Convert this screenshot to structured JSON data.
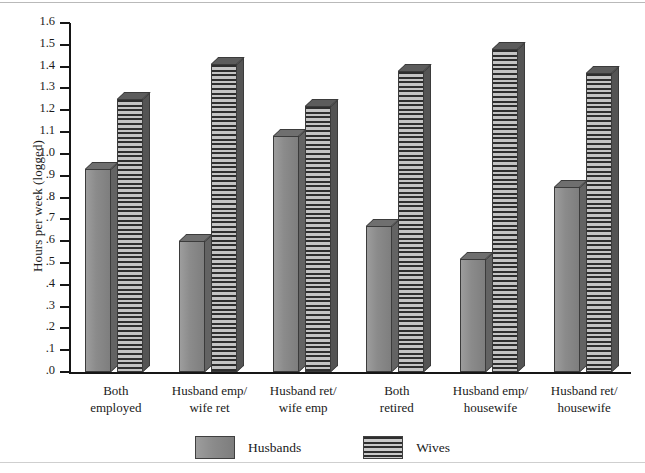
{
  "chart_data": {
    "type": "bar",
    "title": "",
    "subtitle": "",
    "xlabel": "",
    "ylabel": "Hours per week (logged)",
    "ylim": [
      0.0,
      1.6
    ],
    "ytick_step": 0.1,
    "grid": false,
    "legend_position": "bottom-center",
    "categories": [
      "Both\nemployed",
      "Husband emp/\nwife ret",
      "Husband ret/\nwife emp",
      "Both\nretired",
      "Husband emp/\nhousewife",
      "Husband ret/\nhousewife"
    ],
    "series": [
      {
        "name": "Husbands",
        "color": "#8b8b8b",
        "fill": "solid-gray",
        "values": [
          0.93,
          0.6,
          1.08,
          0.67,
          0.52,
          0.85
        ]
      },
      {
        "name": "Wives",
        "color": "#5c5c5c",
        "fill": "horizontal-hatch",
        "values": [
          1.25,
          1.41,
          1.22,
          1.38,
          1.48,
          1.37
        ]
      }
    ],
    "ytick_labels": [
      "1.6",
      "1.5",
      "1.4",
      "1.3",
      "1.2",
      "1.1",
      "1.0",
      ".9",
      ".8",
      ".7",
      ".6",
      ".5",
      ".4",
      ".3",
      ".2",
      ".1",
      ".0"
    ],
    "ytick_values": [
      1.6,
      1.5,
      1.4,
      1.3,
      1.2,
      1.1,
      1.0,
      0.9,
      0.8,
      0.7,
      0.6,
      0.5,
      0.4,
      0.3,
      0.2,
      0.1,
      0.0
    ]
  },
  "axis": {
    "y_title": "Hours per week (logged)"
  },
  "legend": {
    "entries": [
      {
        "label": "Husbands",
        "swatch": "solid-gray-swatch"
      },
      {
        "label": "Wives",
        "swatch": "hatched-gray-swatch"
      }
    ]
  },
  "categories_display": [
    {
      "line1": "Both",
      "line2": "employed"
    },
    {
      "line1": "Husband emp/",
      "line2": "wife ret"
    },
    {
      "line1": "Husband ret/",
      "line2": "wife emp"
    },
    {
      "line1": "Both",
      "line2": "retired"
    },
    {
      "line1": "Husband emp/",
      "line2": "housewife"
    },
    {
      "line1": "Husband ret/",
      "line2": "housewife"
    }
  ]
}
